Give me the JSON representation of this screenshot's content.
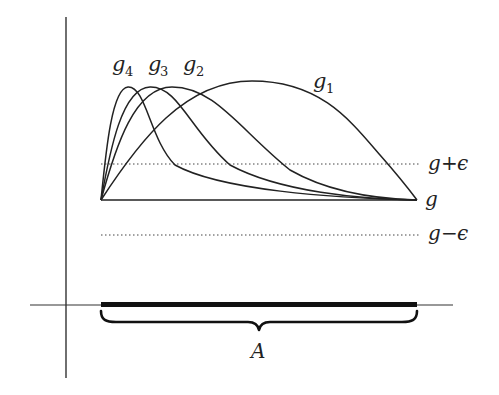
{
  "figure": {
    "curves": [
      {
        "name": "g_4",
        "label_main": "g",
        "label_sub": "4",
        "peak_x": 128,
        "peak_y": 87
      },
      {
        "name": "g_3",
        "label_main": "g",
        "label_sub": "3",
        "peak_x": 150,
        "peak_y": 87
      },
      {
        "name": "g_2",
        "label_main": "g",
        "label_sub": "2",
        "peak_x": 172,
        "peak_y": 87
      },
      {
        "name": "g_1",
        "label_main": "g",
        "label_sub": "1",
        "peak_x": 252,
        "peak_y": 81
      }
    ],
    "labels": {
      "g4_main": "g",
      "g4_sub": "4",
      "g3_main": "g",
      "g3_sub": "3",
      "g2_main": "g",
      "g2_sub": "2",
      "g1_main": "g",
      "g1_sub": "1",
      "upper_band_main": "g",
      "upper_band_op": "+",
      "upper_band_eps": "ϵ",
      "baseline": "g",
      "lower_band_main": "g",
      "lower_band_op": "−",
      "lower_band_eps": "ϵ",
      "set": "A"
    },
    "colors": {
      "stroke": "#222222",
      "axis": "#333333",
      "background": "#ffffff"
    }
  }
}
